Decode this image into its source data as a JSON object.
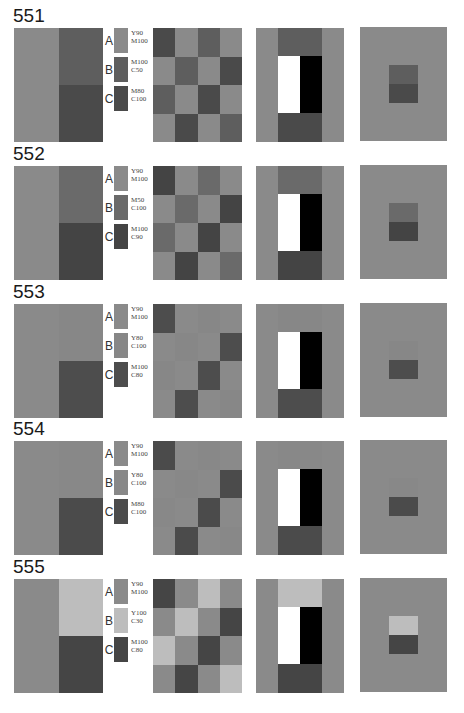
{
  "colors": {
    "A": "#8a8a8a",
    "B551": "#5e5e5e",
    "C551": "#4a4a4a",
    "B552": "#6a6a6a",
    "C552": "#444444",
    "B553": "#878787",
    "C553": "#4d4d4d",
    "B554": "#888888",
    "C554": "#4b4b4b",
    "B555": "#bdbdbd",
    "C555": "#454545",
    "white": "#ffffff",
    "black": "#000000"
  },
  "sections": [
    {
      "title": "551",
      "swatches": [
        {
          "label": "A",
          "text": "Y90\nM100"
        },
        {
          "label": "B",
          "text": "M100\nC50"
        },
        {
          "label": "C",
          "text": "M80\nC100"
        }
      ]
    },
    {
      "title": "552",
      "swatches": [
        {
          "label": "A",
          "text": "Y90\nM100"
        },
        {
          "label": "B",
          "text": "M50\nC100"
        },
        {
          "label": "C",
          "text": "M100\nC90"
        }
      ]
    },
    {
      "title": "553",
      "swatches": [
        {
          "label": "A",
          "text": "Y90\nM100"
        },
        {
          "label": "B",
          "text": "Y80\nC100"
        },
        {
          "label": "C",
          "text": "M100\nC80"
        }
      ]
    },
    {
      "title": "554",
      "swatches": [
        {
          "label": "A",
          "text": "Y90\nM100"
        },
        {
          "label": "B",
          "text": "Y80\nC100"
        },
        {
          "label": "C",
          "text": "M80\nC100"
        }
      ]
    },
    {
      "title": "555",
      "swatches": [
        {
          "label": "A",
          "text": "Y90\nM100"
        },
        {
          "label": "B",
          "text": "Y100\nC30"
        },
        {
          "label": "C",
          "text": "M100\nC80"
        }
      ]
    }
  ],
  "checker_pattern": [
    [
      "C",
      "A",
      "B",
      "A"
    ],
    [
      "A",
      "B",
      "A",
      "C"
    ],
    [
      "B",
      "A",
      "C",
      "A"
    ],
    [
      "A",
      "C",
      "A",
      "B"
    ]
  ]
}
